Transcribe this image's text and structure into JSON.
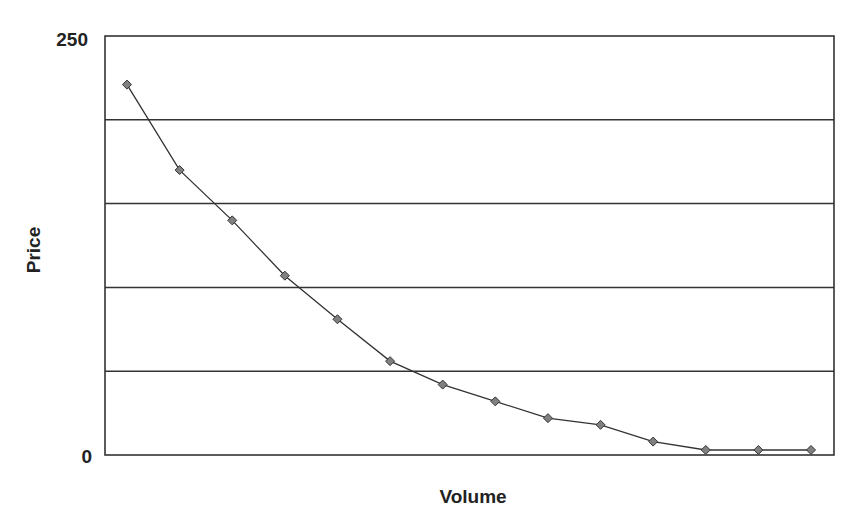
{
  "chart_data": {
    "type": "line",
    "title": "",
    "xlabel": "Volume",
    "ylabel": "Price",
    "ylim": [
      0,
      250
    ],
    "yticks": [
      0,
      250
    ],
    "gridlines_y": [
      50,
      100,
      150,
      200
    ],
    "grid": true,
    "legend": "none",
    "x": [
      1,
      2,
      3,
      4,
      5,
      6,
      7,
      8,
      9,
      10,
      11,
      12,
      13,
      14
    ],
    "series": [
      {
        "name": "Price",
        "marker": "diamond",
        "color": "#808080",
        "values": [
          221,
          170,
          140,
          107,
          81,
          56,
          42,
          32,
          22,
          18,
          8,
          3,
          3,
          3
        ]
      }
    ]
  },
  "labels": {
    "y_max": "250",
    "y_min": "0",
    "xlabel": "Volume",
    "ylabel": "Price"
  }
}
